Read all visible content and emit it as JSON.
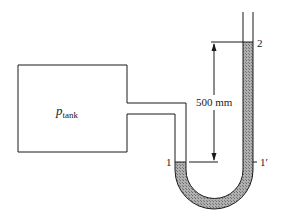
{
  "diagram": {
    "type": "U-tube manometer connected to a tank",
    "tank": {
      "label_main": "p",
      "label_sub": "tank"
    },
    "dimension": {
      "label": "500 mm"
    },
    "points": {
      "left_level": "1",
      "right_level": "1′",
      "top_level": "2"
    },
    "colors": {
      "line": "#1a1a1a",
      "fluid": "#9a9a9a",
      "background": "#ffffff"
    }
  }
}
